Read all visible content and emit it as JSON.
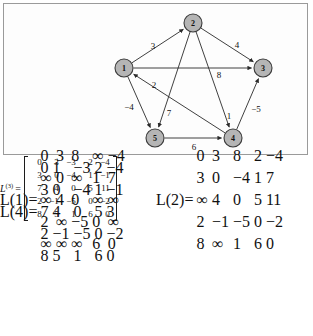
{
  "figure": {
    "graph": {
      "nodes": [
        {
          "id": "1",
          "label": "1",
          "x": 123,
          "y": 67
        },
        {
          "id": "2",
          "label": "2",
          "x": 192,
          "y": 22
        },
        {
          "id": "3",
          "label": "3",
          "x": 262,
          "y": 67
        },
        {
          "id": "4",
          "label": "4",
          "x": 232,
          "y": 137
        },
        {
          "id": "5",
          "label": "5",
          "x": 154,
          "y": 137
        }
      ],
      "node_radius": 9,
      "node_fill": "#b5b5b5",
      "node_stroke": "#3a3a3a",
      "edges": [
        {
          "from": "1",
          "to": "2",
          "weight": "3",
          "lx": 152,
          "ly": 45
        },
        {
          "from": "1",
          "to": "3",
          "weight": "8",
          "lx": 218,
          "ly": 74
        },
        {
          "from": "1",
          "to": "5",
          "weight": "-4",
          "lx": 128,
          "ly": 106
        },
        {
          "from": "2",
          "to": "3",
          "weight": "4",
          "lx": 236,
          "ly": 44
        },
        {
          "from": "2",
          "to": "4",
          "weight": "1",
          "lx": 228,
          "ly": 115
        },
        {
          "from": "2",
          "to": "5",
          "weight": "7",
          "lx": 168,
          "ly": 112
        },
        {
          "from": "4",
          "to": "1",
          "weight": "2",
          "lx": 153,
          "ly": 84
        },
        {
          "from": "4",
          "to": "3",
          "weight": "-5",
          "lx": 255,
          "ly": 108
        },
        {
          "from": "5",
          "to": "4",
          "weight": "6",
          "lx": 193,
          "ly": 146
        }
      ]
    },
    "matrices": [
      {
        "name": "L",
        "superscript": "(1)",
        "equals": "=",
        "rows": [
          [
            "0",
            "3",
            "8",
            "∞",
            "−4"
          ],
          [
            "∞",
            "0",
            "∞",
            "1",
            "7"
          ],
          [
            "∞",
            "4",
            "0",
            "∞",
            "∞"
          ],
          [
            "2",
            "∞",
            "−5",
            "0",
            "∞"
          ],
          [
            "∞",
            "∞",
            "∞",
            "6",
            "0"
          ]
        ]
      },
      {
        "name": "L",
        "superscript": "(2)",
        "equals": "=",
        "rows": [
          [
            "0",
            "3",
            "8",
            "2",
            "−4"
          ],
          [
            "3",
            "0",
            "−4",
            "1",
            "7"
          ],
          [
            "∞",
            "4",
            "0",
            "5",
            "11"
          ],
          [
            "2",
            "−1",
            "−5",
            "0",
            "−2"
          ],
          [
            "8",
            "∞",
            "1",
            "6",
            "0"
          ]
        ]
      },
      {
        "name": "L",
        "superscript": "(3)",
        "equals": "=",
        "rows": [
          [
            "0",
            "3",
            "−3",
            "2",
            "−4"
          ],
          [
            "3",
            "0",
            "−4",
            "1",
            "−1"
          ],
          [
            "7",
            "4",
            "0",
            "5",
            "11"
          ],
          [
            "2",
            "−1",
            "−5",
            "0",
            "−2"
          ],
          [
            "8",
            "5",
            "1",
            "6",
            "0"
          ]
        ]
      },
      {
        "name": "L",
        "superscript": "(4)",
        "equals": "=",
        "rows": [
          [
            "0",
            "1",
            "−3",
            "2",
            "−4"
          ],
          [
            "3",
            "0",
            "−4",
            "1",
            "−1"
          ],
          [
            "7",
            "4",
            "0",
            "5",
            "3"
          ],
          [
            "2",
            "−1",
            "−5",
            "0",
            "−2"
          ],
          [
            "8",
            "5",
            "1",
            "6",
            "0"
          ]
        ]
      }
    ]
  }
}
